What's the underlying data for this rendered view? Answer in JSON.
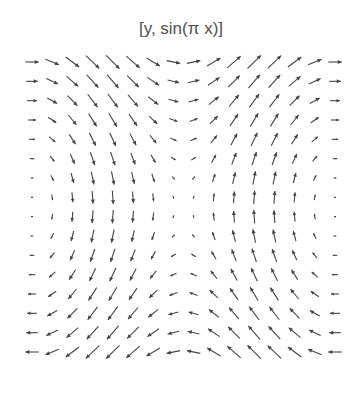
{
  "chart_data": {
    "type": "vector_field",
    "title": "[y, sin(π x)]",
    "field": {
      "u": "y",
      "v": "sin(pi x)"
    },
    "xrange": [
      -1,
      1
    ],
    "yrange": [
      -1,
      1
    ],
    "grid": {
      "nx": 16,
      "ny": 16
    },
    "xlabel": "",
    "ylabel": "",
    "axes": false,
    "gridlines": false,
    "legend": null,
    "arrow_color": "#444444"
  },
  "layout": {
    "plot_left": 32,
    "plot_right": 335,
    "plot_top": 62,
    "plot_bottom": 352,
    "max_arrow_len": 19
  }
}
